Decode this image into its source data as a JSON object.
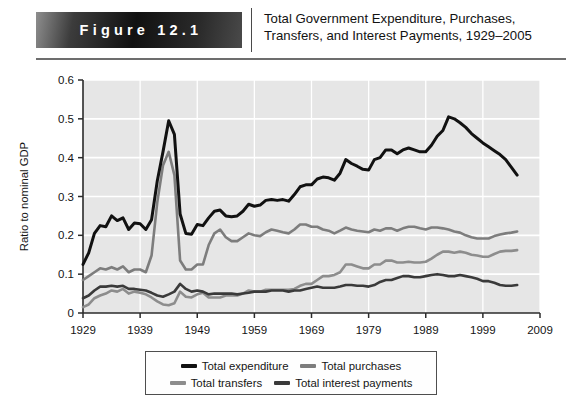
{
  "header": {
    "badge_label": "Figure 12.1",
    "title": "Total Government Expenditure, Purchases, Transfers, and Interest Payments, 1929–2005"
  },
  "legend": {
    "entries": [
      {
        "label": "Total expenditure",
        "color": "#111111"
      },
      {
        "label": "Total purchases",
        "color": "#7d7d7d"
      },
      {
        "label": "Total transfers",
        "color": "#8d8d8d"
      },
      {
        "label": "Total interest payments",
        "color": "#3a3a3a"
      }
    ]
  },
  "chart_data": {
    "type": "line",
    "title": "Total Government Expenditure, Purchases, Transfers, and Interest Payments, 1929–2005",
    "xlabel": "",
    "ylabel": "Ratio to nominal GDP",
    "xlim": [
      1929,
      2009
    ],
    "ylim": [
      0,
      0.6
    ],
    "xticks": [
      1929,
      1939,
      1949,
      1959,
      1969,
      1979,
      1989,
      1999,
      2009
    ],
    "yticks": [
      0,
      0.1,
      0.2,
      0.3,
      0.4,
      0.5,
      0.6
    ],
    "grid": true,
    "legend_position": "bottom",
    "plot_background": "#e6e6e6",
    "x": [
      1929,
      1930,
      1931,
      1932,
      1933,
      1934,
      1935,
      1936,
      1937,
      1938,
      1939,
      1940,
      1941,
      1942,
      1943,
      1944,
      1945,
      1946,
      1947,
      1948,
      1949,
      1950,
      1951,
      1952,
      1953,
      1954,
      1955,
      1956,
      1957,
      1958,
      1959,
      1960,
      1961,
      1962,
      1963,
      1964,
      1965,
      1966,
      1967,
      1968,
      1969,
      1970,
      1971,
      1972,
      1973,
      1974,
      1975,
      1976,
      1977,
      1978,
      1979,
      1980,
      1981,
      1982,
      1983,
      1984,
      1985,
      1986,
      1987,
      1988,
      1989,
      1990,
      1991,
      1992,
      1993,
      1994,
      1995,
      1996,
      1997,
      1998,
      1999,
      2000,
      2001,
      2002,
      2003,
      2004,
      2005
    ],
    "series": [
      {
        "name": "Total expenditure",
        "color": "#111111",
        "values": [
          0.125,
          0.155,
          0.205,
          0.225,
          0.222,
          0.25,
          0.238,
          0.245,
          0.215,
          0.232,
          0.23,
          0.215,
          0.24,
          0.34,
          0.415,
          0.495,
          0.46,
          0.255,
          0.205,
          0.203,
          0.228,
          0.225,
          0.245,
          0.262,
          0.265,
          0.25,
          0.248,
          0.25,
          0.262,
          0.28,
          0.275,
          0.278,
          0.29,
          0.292,
          0.29,
          0.292,
          0.288,
          0.305,
          0.325,
          0.33,
          0.33,
          0.345,
          0.35,
          0.348,
          0.342,
          0.36,
          0.395,
          0.385,
          0.378,
          0.37,
          0.368,
          0.395,
          0.4,
          0.42,
          0.42,
          0.41,
          0.42,
          0.425,
          0.42,
          0.415,
          0.415,
          0.432,
          0.455,
          0.47,
          0.505,
          0.5,
          0.49,
          0.478,
          0.462,
          0.45,
          0.438,
          0.428,
          0.418,
          0.408,
          0.395,
          0.375,
          0.355
        ]
      },
      {
        "name": "Total purchases",
        "color": "#7d7d7d",
        "values": [
          0.085,
          0.095,
          0.105,
          0.115,
          0.112,
          0.118,
          0.112,
          0.12,
          0.105,
          0.112,
          0.112,
          0.105,
          0.148,
          0.285,
          0.38,
          0.415,
          0.355,
          0.135,
          0.112,
          0.112,
          0.125,
          0.125,
          0.175,
          0.205,
          0.215,
          0.195,
          0.185,
          0.185,
          0.195,
          0.205,
          0.2,
          0.198,
          0.208,
          0.215,
          0.212,
          0.208,
          0.205,
          0.215,
          0.228,
          0.228,
          0.222,
          0.222,
          0.215,
          0.212,
          0.205,
          0.212,
          0.22,
          0.215,
          0.212,
          0.21,
          0.208,
          0.215,
          0.212,
          0.218,
          0.218,
          0.212,
          0.218,
          0.222,
          0.222,
          0.218,
          0.215,
          0.22,
          0.22,
          0.218,
          0.215,
          0.21,
          0.207,
          0.2,
          0.195,
          0.192,
          0.192,
          0.192,
          0.198,
          0.202,
          0.205,
          0.207,
          0.21
        ]
      },
      {
        "name": "Total transfers",
        "color": "#8d8d8d",
        "values": [
          0.015,
          0.022,
          0.038,
          0.045,
          0.05,
          0.058,
          0.055,
          0.062,
          0.05,
          0.055,
          0.052,
          0.048,
          0.04,
          0.03,
          0.022,
          0.02,
          0.025,
          0.055,
          0.042,
          0.04,
          0.048,
          0.052,
          0.04,
          0.04,
          0.04,
          0.045,
          0.045,
          0.045,
          0.05,
          0.058,
          0.055,
          0.055,
          0.06,
          0.06,
          0.06,
          0.06,
          0.06,
          0.062,
          0.07,
          0.075,
          0.075,
          0.085,
          0.095,
          0.095,
          0.098,
          0.105,
          0.125,
          0.125,
          0.12,
          0.115,
          0.115,
          0.125,
          0.125,
          0.135,
          0.135,
          0.13,
          0.13,
          0.132,
          0.13,
          0.13,
          0.132,
          0.14,
          0.15,
          0.158,
          0.158,
          0.155,
          0.158,
          0.155,
          0.15,
          0.148,
          0.145,
          0.145,
          0.152,
          0.158,
          0.16,
          0.16,
          0.162
        ]
      },
      {
        "name": "Total interest payments",
        "color": "#3a3a3a",
        "values": [
          0.038,
          0.045,
          0.058,
          0.068,
          0.068,
          0.07,
          0.068,
          0.07,
          0.062,
          0.062,
          0.06,
          0.058,
          0.052,
          0.045,
          0.042,
          0.048,
          0.055,
          0.075,
          0.062,
          0.055,
          0.058,
          0.055,
          0.048,
          0.05,
          0.05,
          0.05,
          0.05,
          0.048,
          0.05,
          0.052,
          0.055,
          0.055,
          0.055,
          0.058,
          0.058,
          0.058,
          0.055,
          0.058,
          0.058,
          0.062,
          0.065,
          0.068,
          0.065,
          0.065,
          0.065,
          0.068,
          0.072,
          0.072,
          0.07,
          0.07,
          0.068,
          0.072,
          0.08,
          0.085,
          0.085,
          0.09,
          0.095,
          0.095,
          0.092,
          0.092,
          0.095,
          0.098,
          0.1,
          0.098,
          0.095,
          0.095,
          0.098,
          0.095,
          0.092,
          0.088,
          0.082,
          0.082,
          0.078,
          0.072,
          0.07,
          0.07,
          0.072
        ]
      }
    ]
  }
}
